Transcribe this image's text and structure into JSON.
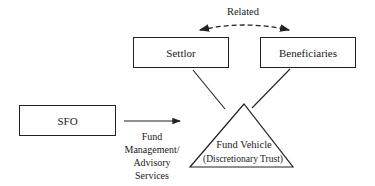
{
  "diagram": {
    "relation_label": "Related",
    "nodes": {
      "settlor": "Settlor",
      "beneficiaries": "Beneficiaries",
      "sfo": "SFO",
      "fund_vehicle": "Fund Vehicle",
      "fund_vehicle_sub": "(Discretionary Trust)"
    },
    "edge_label": {
      "line1": "Fund",
      "line2": "Management/",
      "line3": "Advisory",
      "line4": "Services"
    },
    "colors": {
      "stroke": "#222222",
      "background": "#ffffff"
    }
  }
}
